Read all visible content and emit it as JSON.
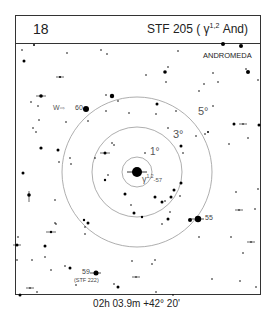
{
  "header": {
    "chart_number": "18",
    "title_prefix": "STF 205 ( ",
    "title_greek": "γ",
    "title_sup": "1,2",
    "title_suffix": " And)"
  },
  "map": {
    "constellation_label": "ANDROMEDA",
    "center_star_label": "γ",
    "center_star_sup": "1,2",
    "center_star_number": "-57",
    "circles": [
      {
        "label": "1°",
        "radius_deg": 1
      },
      {
        "label": "3°",
        "radius_deg": 3
      },
      {
        "label": "5°",
        "radius_deg": 5
      }
    ],
    "star_labels": [
      {
        "id": "60",
        "text": "60"
      },
      {
        "id": "55",
        "text": "55"
      },
      {
        "id": "59",
        "text": "59"
      },
      {
        "id": "stf222",
        "text": "(STF 222)"
      }
    ],
    "direction_label": "W",
    "direction_arrow": "⇨"
  },
  "footer": {
    "coordinates": "02h 03.9m  +42° 20'"
  }
}
